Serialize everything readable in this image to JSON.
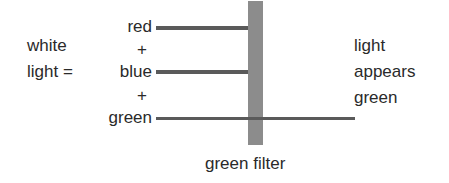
{
  "diagram": {
    "left_label": {
      "line1": "white",
      "line2": "light ="
    },
    "components": [
      {
        "label": "red"
      },
      {
        "label": "+"
      },
      {
        "label": "blue"
      },
      {
        "label": "+"
      },
      {
        "label": "green"
      }
    ],
    "filter_label": "green filter",
    "result_label": {
      "line1": "light",
      "line2": "appears",
      "line3": "green"
    },
    "colors": {
      "ray": "#5a5a5a",
      "filter": "#8c8c8c",
      "text": "#2a2a2a"
    }
  }
}
